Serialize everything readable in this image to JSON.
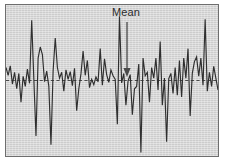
{
  "figure": {
    "background_color": "#ffffff",
    "plot_background_color": "#d5d5d5",
    "frame_color": "#6e6e6e",
    "series_color": "#2f2f2f",
    "mean_line_color": "#4a4a4a"
  },
  "annotation": {
    "mean_label": "Mean",
    "arrow_x": 127,
    "arrow_top_y": 22,
    "arrow_bottom_y": 77
  },
  "chart_data": {
    "type": "line",
    "title": "",
    "xlabel": "",
    "ylabel": "",
    "grid": false,
    "legend_position": "none",
    "axis_ticks_visible": false,
    "annotations": [
      {
        "text": "Mean",
        "kind": "arrow-to-mean-line",
        "points_to": "mean"
      }
    ],
    "reference_lines": [
      {
        "name": "mean",
        "value": 0,
        "style": "dashed",
        "orientation": "horizontal"
      }
    ],
    "ylim": [
      -3.2,
      3.2
    ],
    "xlim": [
      0,
      99
    ],
    "series": [
      {
        "name": "observations",
        "values": [
          0.55,
          0.22,
          0.62,
          -0.15,
          0.35,
          -0.35,
          0.3,
          -0.92,
          0.18,
          -0.25,
          0.48,
          -0.12,
          2.55,
          0.05,
          -2.35,
          0.95,
          1.42,
          1.1,
          -0.05,
          0.4,
          -0.25,
          -2.72,
          0.4,
          1.8,
          0.55,
          0.1,
          0.35,
          -0.45,
          0.45,
          0.05,
          0.38,
          -0.22,
          0.52,
          -1.28,
          -0.35,
          0.28,
          1.25,
          0.22,
          0.85,
          -0.3,
          0.05,
          -0.18,
          0.15,
          -0.05,
          1.35,
          -0.2,
          0.92,
          0.25,
          -0.08,
          0.45,
          0.2,
          0.05,
          -1.85,
          2.72,
          -0.1,
          0.3,
          -1.05,
          -0.02,
          0.25,
          -1.45,
          -0.35,
          -0.25,
          0.7,
          -3.05,
          0.95,
          0.2,
          0.35,
          -0.92,
          0.55,
          0.1,
          0.95,
          -0.4,
          1.65,
          -1.05,
          0.1,
          -2.6,
          0.08,
          0.3,
          -0.55,
          0.55,
          -0.62,
          0.85,
          -0.7,
          0.95,
          0.1,
          1.35,
          -1.5,
          0.3,
          0.8,
          1.0,
          0.18,
          0.95,
          -0.2,
          2.6,
          -0.45,
          0.35,
          -0.25,
          0.6,
          0.1,
          -0.4
        ]
      }
    ]
  }
}
